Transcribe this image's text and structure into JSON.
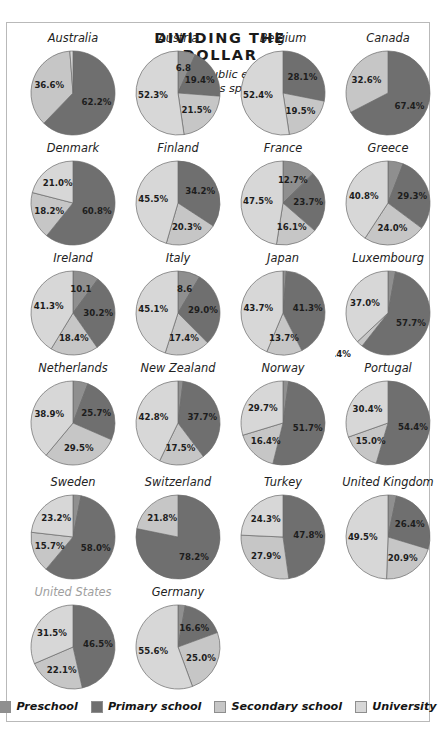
{
  "title": {
    "main": "DIVIDING THE DOLLAR",
    "subtitle": "Percent of public education expenditures spent on..."
  },
  "legend": {
    "items": [
      {
        "label": "Preschool",
        "color": "#8f8f8f"
      },
      {
        "label": "Primary school",
        "color": "#6f6f6f"
      },
      {
        "label": "Secondary school",
        "color": "#c6c6c6"
      },
      {
        "label": "University",
        "color": "#d7d7d7"
      }
    ]
  },
  "chart_data": {
    "type": "pie",
    "title": "DIVIDING THE DOLLAR",
    "subtitle": "Percent of public education expenditures spent on...",
    "categories": [
      "Preschool",
      "Primary school",
      "Secondary school",
      "University"
    ],
    "colors": [
      "#8f8f8f",
      "#6f6f6f",
      "#c6c6c6",
      "#d7d7d7"
    ],
    "legend_position": "bottom",
    "unit": "percent",
    "charts": [
      {
        "name": "Australia",
        "muted": false,
        "values": [
          0,
          62.2,
          36.6,
          1.2
        ],
        "labels": [
          "",
          "62.2%",
          "36.6%",
          "1.2%"
        ]
      },
      {
        "name": "Austria",
        "muted": false,
        "values": [
          6.8,
          19.4,
          21.5,
          52.3
        ],
        "labels": [
          "6.8",
          "19.4%",
          "21.5%",
          "52.3%"
        ]
      },
      {
        "name": "Belgium",
        "muted": false,
        "values": [
          0,
          28.1,
          19.5,
          52.4
        ],
        "labels": [
          "",
          "28.1%",
          "19.5%",
          "52.4%"
        ]
      },
      {
        "name": "Canada",
        "muted": false,
        "values": [
          0,
          67.4,
          32.6,
          0
        ],
        "labels": [
          "",
          "67.4%",
          "32.6%",
          ""
        ]
      },
      {
        "name": "Denmark",
        "muted": false,
        "values": [
          0,
          60.8,
          18.2,
          21.0
        ],
        "labels": [
          "",
          "60.8%",
          "18.2%",
          "21.0%"
        ]
      },
      {
        "name": "Finland",
        "muted": false,
        "values": [
          0,
          34.2,
          20.3,
          45.5
        ],
        "labels": [
          "",
          "34.2%",
          "20.3%",
          "45.5%"
        ]
      },
      {
        "name": "France",
        "muted": false,
        "values": [
          12.7,
          23.7,
          16.1,
          47.5
        ],
        "labels": [
          "12.7%",
          "23.7%",
          "16.1%",
          "47.5%"
        ]
      },
      {
        "name": "Greece",
        "muted": false,
        "values": [
          5.9,
          29.3,
          24.0,
          40.8
        ],
        "labels": [
          "5.9",
          "29.3%",
          "24.0%",
          "40.8%"
        ]
      },
      {
        "name": "Ireland",
        "muted": false,
        "values": [
          10.1,
          30.2,
          18.4,
          41.3
        ],
        "labels": [
          "10.1",
          "30.2%",
          "18.4%",
          "41.3%"
        ]
      },
      {
        "name": "Italy",
        "muted": false,
        "values": [
          8.6,
          29.0,
          17.4,
          45.1
        ],
        "labels": [
          "8.6",
          "29.0%",
          "17.4%",
          "45.1%"
        ]
      },
      {
        "name": "Japan",
        "muted": false,
        "values": [
          1.3,
          41.3,
          13.7,
          43.7
        ],
        "labels": [
          "1.3%",
          "41.3%",
          "13.7%",
          "43.7%"
        ]
      },
      {
        "name": "Luxembourg",
        "muted": false,
        "values": [
          2.9,
          57.7,
          2.4,
          37.0
        ],
        "labels": [
          "2.9%",
          "57.7%",
          "2.4%",
          "37.0%"
        ]
      },
      {
        "name": "Netherlands",
        "muted": false,
        "values": [
          5.8,
          25.7,
          29.5,
          38.9
        ],
        "labels": [
          "5.8",
          "25.7%",
          "29.5%",
          "38.9%"
        ]
      },
      {
        "name": "New Zealand",
        "muted": false,
        "values": [
          2.0,
          37.7,
          17.5,
          42.8
        ],
        "labels": [
          "2.0%",
          "37.7%",
          "17.5%",
          "42.8%"
        ]
      },
      {
        "name": "Norway",
        "muted": false,
        "values": [
          2.2,
          51.7,
          16.4,
          29.7
        ],
        "labels": [
          "2.2%",
          "51.7%",
          "16.4%",
          "29.7%"
        ]
      },
      {
        "name": "Portugal",
        "muted": false,
        "values": [
          0.1,
          54.4,
          15.0,
          30.4
        ],
        "labels": [
          "0.1%",
          "54.4%",
          "15.0%",
          "30.4%"
        ]
      },
      {
        "name": "Sweden",
        "muted": false,
        "values": [
          3.1,
          58.0,
          15.7,
          23.2
        ],
        "labels": [
          "3.1%",
          "58.0%",
          "15.7%",
          "23.2%"
        ]
      },
      {
        "name": "Switzerland",
        "muted": false,
        "values": [
          0,
          78.2,
          21.8,
          0
        ],
        "labels": [
          "",
          "78.2%",
          "21.8%",
          ""
        ]
      },
      {
        "name": "Turkey",
        "muted": false,
        "values": [
          0,
          47.8,
          27.9,
          24.3
        ],
        "labels": [
          "",
          "47.8%",
          "27.9%",
          "24.3%"
        ]
      },
      {
        "name": "United Kingdom",
        "muted": false,
        "values": [
          3.3,
          26.4,
          20.9,
          49.5
        ],
        "labels": [
          "3.3%",
          "26.4%",
          "20.9%",
          "49.5%"
        ]
      },
      {
        "name": "United States",
        "muted": true,
        "values": [
          0,
          46.5,
          22.1,
          31.5
        ],
        "labels": [
          "",
          "46.5%",
          "22.1%",
          "31.5%"
        ]
      },
      {
        "name": "Germany",
        "muted": false,
        "values": [
          2.8,
          16.6,
          25.0,
          55.6
        ],
        "labels": [
          "2.8%",
          "16.6%",
          "25.0%",
          "55.6%"
        ]
      }
    ]
  }
}
